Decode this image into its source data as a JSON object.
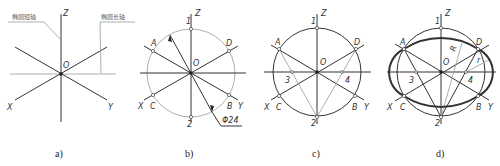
{
  "figure": {
    "panels": [
      {
        "id": "a",
        "caption": "a)",
        "axes": {
          "z": "Z",
          "x": "X",
          "y": "Y",
          "origin": "O"
        },
        "annotations": {
          "minor_axis": "椭圆短轴",
          "major_axis": "椭圆长轴"
        }
      },
      {
        "id": "b",
        "caption": "b)",
        "axes": {
          "z": "Z",
          "x": "X",
          "y": "Y",
          "origin": "O"
        },
        "points": {
          "p1": "1",
          "p2": "2",
          "a": "A",
          "b": "B",
          "c": "C",
          "d": "D"
        },
        "dimension": "Φ24"
      },
      {
        "id": "c",
        "caption": "c)",
        "axes": {
          "z": "Z",
          "x": "X",
          "y": "Y",
          "origin": "O"
        },
        "points": {
          "p1": "1",
          "p2": "2",
          "p3": "3",
          "p4": "4",
          "a": "A",
          "b": "B",
          "c": "C",
          "d": "D"
        }
      },
      {
        "id": "d",
        "caption": "d)",
        "axes": {
          "z": "Z",
          "x": "X",
          "y": "Y",
          "origin": "O"
        },
        "points": {
          "p1": "1",
          "p2": "2",
          "p3": "3",
          "p4": "4",
          "a": "A",
          "b": "B",
          "c": "C",
          "d": "D"
        },
        "radii": {
          "large": "R",
          "small": "r"
        }
      }
    ]
  }
}
